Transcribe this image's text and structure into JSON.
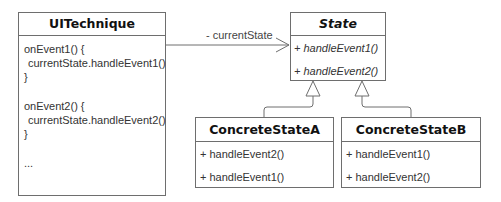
{
  "diagram": {
    "type": "UML class diagram (State pattern)",
    "classes": {
      "ui_technique": {
        "name": "UITechnique",
        "body_lines": [
          "onEvent1() {",
          " currentState.handleEvent1()",
          "}",
          "onEvent2() {",
          " currentState.handleEvent2()",
          "}",
          "..."
        ]
      },
      "state": {
        "name": "State",
        "abstract": true,
        "methods": [
          "+ handleEvent1()",
          "+ handleEvent2()"
        ]
      },
      "concrete_a": {
        "name": "ConcreteStateA",
        "methods": [
          "+ handleEvent2()",
          "+ handleEvent1()"
        ]
      },
      "concrete_b": {
        "name": "ConcreteStateB",
        "methods": [
          "+ handleEvent1()",
          "+ handleEvent2()"
        ]
      }
    },
    "associations": [
      {
        "from": "UITechnique",
        "to": "State",
        "label": "- currentState",
        "arrow": "open"
      }
    ],
    "generalizations": [
      {
        "child": "ConcreteStateA",
        "parent": "State"
      },
      {
        "child": "ConcreteStateB",
        "parent": "State"
      }
    ],
    "colors": {
      "stroke": "#6e6e6e",
      "text": "#222222",
      "background": "#ffffff"
    }
  }
}
